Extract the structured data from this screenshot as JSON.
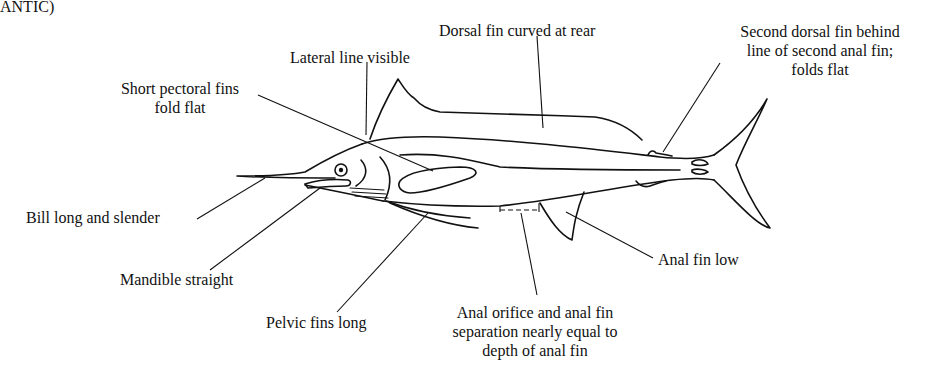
{
  "header": {
    "title_fragment": "ANTIC)"
  },
  "diagram": {
    "labels": [
      {
        "id": "lateral-line",
        "text": "Lateral line visible"
      },
      {
        "id": "dorsal-fin",
        "text": "Dorsal fin curved at rear"
      },
      {
        "id": "second-dorsal",
        "lines": [
          "Second dorsal fin behind",
          "line of second anal fin;",
          "folds flat"
        ]
      },
      {
        "id": "pectoral",
        "lines": [
          "Short pectoral fins",
          "fold flat"
        ]
      },
      {
        "id": "bill",
        "text": "Bill long and slender"
      },
      {
        "id": "mandible",
        "text": "Mandible straight"
      },
      {
        "id": "pelvic",
        "text": "Pelvic fins long"
      },
      {
        "id": "anal-orifice",
        "lines": [
          "Anal orifice and anal fin",
          "separation nearly equal to",
          "depth of anal fin"
        ]
      },
      {
        "id": "anal-fin",
        "text": "Anal fin low"
      }
    ]
  }
}
